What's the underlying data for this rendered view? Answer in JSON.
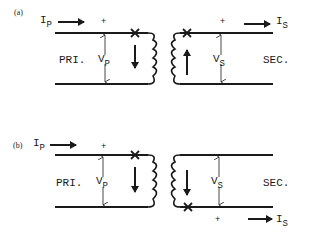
{
  "figure": {
    "panels": [
      {
        "tag": "(a)",
        "primary": {
          "label": "PRI.",
          "current": "I",
          "current_sub": "P",
          "voltage": "V",
          "voltage_sub": "P",
          "plus": "+"
        },
        "secondary": {
          "label": "SEC.",
          "current": "I",
          "current_sub": "S",
          "voltage": "V",
          "voltage_sub": "S",
          "plus": "+"
        },
        "primary_flux_arrow": "down",
        "secondary_flux_arrow": "up",
        "dot_marks": [
          "primary-top",
          "secondary-top"
        ]
      },
      {
        "tag": "(b)",
        "primary": {
          "label": "PRI.",
          "current": "I",
          "current_sub": "P",
          "voltage": "V",
          "voltage_sub": "P",
          "plus": "+"
        },
        "secondary": {
          "label": "SEC.",
          "current": "I",
          "current_sub": "S",
          "voltage": "V",
          "voltage_sub": "S",
          "plus": "+"
        },
        "primary_flux_arrow": "down",
        "secondary_flux_arrow": "down",
        "dot_marks": [
          "primary-top",
          "secondary-bottom"
        ]
      }
    ],
    "colors": {
      "ink": "#1a1a1a",
      "background": "#ffffff"
    }
  }
}
